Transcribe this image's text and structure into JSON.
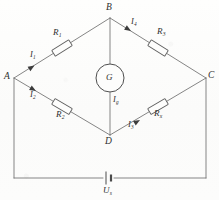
{
  "figure": {
    "type": "circuit-diagram",
    "ink_color": "#6f6f6f",
    "paper_color": "#fdfdfc"
  },
  "nodes": [
    {
      "id": "A",
      "label": "A",
      "x": 14,
      "y": 78
    },
    {
      "id": "B",
      "label": "B",
      "x": 110,
      "y": 18
    },
    {
      "id": "C",
      "label": "C",
      "x": 206,
      "y": 78
    },
    {
      "id": "D",
      "label": "D",
      "x": 110,
      "y": 135
    }
  ],
  "components": {
    "r1": {
      "label": "R",
      "sub": "1",
      "branch": "A-B"
    },
    "r2": {
      "label": "R",
      "sub": "2",
      "branch": "A-D"
    },
    "r3": {
      "label": "R",
      "sub": "3",
      "branch": "B-C"
    },
    "rx": {
      "label": "R",
      "sub": "x",
      "branch": "D-C"
    },
    "galvanometer": {
      "label": "G",
      "branch": "B-D"
    },
    "source": {
      "label": "U",
      "sub": "s",
      "branch": "bottom-loop"
    }
  },
  "currents": [
    {
      "id": "i1",
      "label": "I",
      "sub": "1",
      "branch": "A-B",
      "direction": "A to B"
    },
    {
      "id": "i2",
      "label": "I",
      "sub": "2",
      "branch": "A-D",
      "direction": "A to D"
    },
    {
      "id": "i4",
      "label": "I",
      "sub": "4",
      "branch": "B-C",
      "direction": "B to C"
    },
    {
      "id": "i3",
      "label": "I",
      "sub": "3",
      "branch": "D-C",
      "direction": "D to C"
    },
    {
      "id": "ig",
      "label": "I",
      "sub": "g",
      "branch": "B-D",
      "direction": "B to D"
    }
  ]
}
